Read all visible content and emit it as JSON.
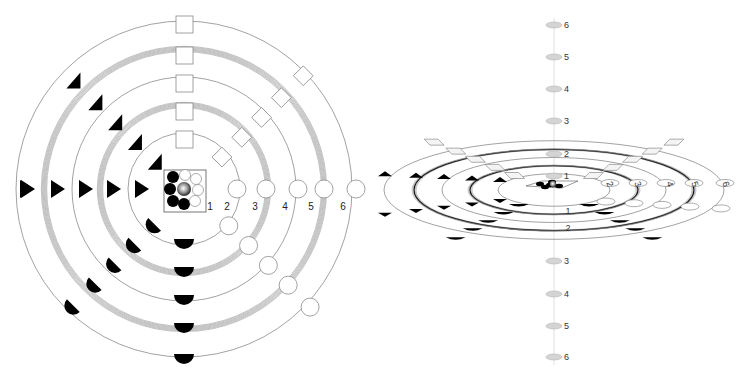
{
  "diagrams": [
    {
      "id": "top-view",
      "title": "",
      "view": "plan",
      "ring_levels": 6,
      "ring_labels": [
        "1",
        "2",
        "3",
        "4",
        "5",
        "6"
      ],
      "ring_styles": [
        "thin",
        "thin",
        "multi-line",
        "thin",
        "multi-line",
        "thin"
      ],
      "markers": {
        "west": "filled-triangle-right",
        "north-west": "filled-triangle-up-right",
        "north": "open-square",
        "north-east": "open-diamond",
        "east": "open-circle",
        "south-east": "open-circle",
        "south": "filled-half-disc",
        "south-west": "filled-half-disc-rotated"
      },
      "center_cluster": {
        "filled_circles": 5,
        "open_circles": 4,
        "center": "shaded-sphere",
        "label": "1"
      }
    },
    {
      "id": "perspective-view",
      "title": "",
      "view": "oblique",
      "axis_labels_above": [
        "6",
        "5",
        "4",
        "3",
        "2",
        "1"
      ],
      "axis_labels_below": [
        "1",
        "2",
        "3",
        "4",
        "5",
        "6"
      ],
      "ring_labels": [
        "2",
        "3",
        "4",
        "5",
        "6"
      ],
      "inner_labels": [
        "1",
        "2"
      ]
    }
  ],
  "colors": {
    "line": "#8a8a8a",
    "fill_dark": "#000000",
    "axis_disc": "#d4d4d4",
    "background": "#ffffff"
  }
}
